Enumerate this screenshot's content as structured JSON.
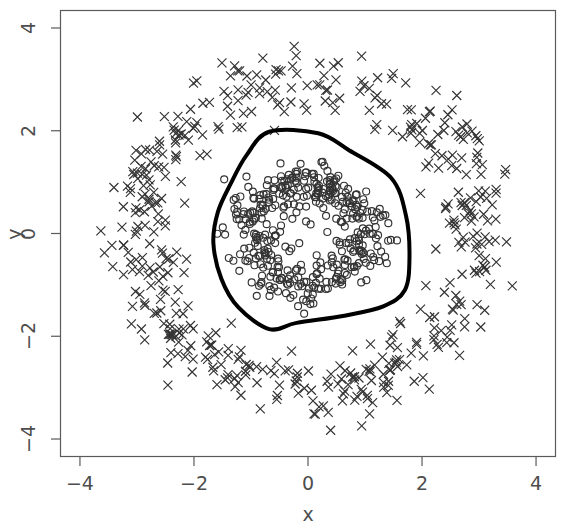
{
  "chart_data": {
    "type": "scatter",
    "title": "",
    "xlabel": "x",
    "ylabel": "y",
    "xlim": [
      -4.35,
      4.35
    ],
    "ylim": [
      -4.35,
      4.35
    ],
    "xticks": [
      -4,
      -2,
      0,
      2,
      4
    ],
    "yticks": [
      -4,
      -2,
      0,
      2,
      4
    ],
    "xtick_labels": [
      "−4",
      "−2",
      "0",
      "2",
      "4"
    ],
    "ytick_labels": [
      "−4",
      "−2",
      "0",
      "2",
      "4"
    ],
    "grid": false,
    "legend": "none",
    "box": true,
    "annotations": [],
    "series": [
      {
        "name": "inner class (circles)",
        "marker": "circle-open",
        "marker_size": 7,
        "color": "#333333",
        "n_points": 400,
        "description": "Noisy ring of open circles, mean radius 1.0, radial sd 0.25, centered at origin",
        "ring": {
          "center": [
            0,
            0
          ],
          "radius": 1.0,
          "radial_noise_sd": 0.25
        },
        "x": [
          -0.11,
          0.9,
          -0.99,
          0.27,
          -0.66,
          1.19,
          0.06,
          -1.02,
          0.84,
          -0.42,
          1.05,
          -0.81,
          0.39,
          -0.18,
          1.12,
          -1.18,
          0.62,
          0.01,
          -0.74,
          0.95,
          -0.51,
          1.21,
          -0.3,
          0.7,
          -1.1,
          0.45,
          -0.93,
          0.15,
          1.08,
          -0.62,
          0.8,
          -1.24,
          0.33,
          0.52,
          -0.86,
          1.02,
          -0.22,
          0.66,
          -1.06,
          0.1,
          0.88,
          -0.7,
          1.16,
          -0.41,
          0.24,
          -1.15,
          0.57,
          0.97,
          -0.55,
          0.36,
          -1.01,
          0.73,
          0.04,
          -0.79,
          1.1,
          -0.35,
          0.6,
          -1.2,
          0.85,
          -0.09,
          0.49,
          -0.96,
          1.22,
          -0.68,
          0.19,
          0.92,
          -1.08,
          0.41,
          0.64,
          -0.47,
          1.04,
          -0.88,
          0.28,
          -0.14,
          1.18,
          -1.12,
          0.75,
          0.08,
          -0.72,
          0.99,
          -0.58,
          1.14,
          -0.26,
          0.68,
          -1.04,
          0.43,
          -0.91,
          0.12,
          1.06,
          -0.65,
          0.78,
          -1.22,
          0.31,
          0.54,
          -0.84,
          1.0,
          -0.2,
          0.71,
          -1.02,
          0.16
        ],
        "y": [
          1.05,
          0.52,
          0.44,
          -1.08,
          0.82,
          -0.31,
          -1.12,
          -0.55,
          0.71,
          1.0,
          0.2,
          -0.8,
          1.09,
          -1.15,
          0.38,
          0.15,
          -0.92,
          1.18,
          0.74,
          -0.48,
          -1.0,
          0.1,
          1.13,
          0.86,
          -0.4,
          -1.05,
          0.58,
          1.2,
          -0.26,
          -0.95,
          0.66,
          0.05,
          -1.18,
          0.99,
          -0.68,
          -0.42,
          1.14,
          -0.88,
          0.3,
          -1.22,
          0.6,
          -0.84,
          0.22,
          1.08,
          -1.1,
          -0.35,
          0.94,
          -0.5,
          0.9,
          1.12,
          0.48,
          -0.78,
          1.22,
          0.7,
          -0.34,
          -1.06,
          0.98,
          -0.18,
          -0.62,
          1.18,
          -1.02,
          -0.44,
          0.08,
          0.88,
          1.16,
          -0.56,
          0.28,
          -1.12,
          0.92,
          1.04,
          0.36,
          -0.64,
          1.2,
          -1.18,
          -0.22,
          0.18,
          0.8,
          -1.21,
          -0.76,
          0.42,
          0.96,
          -0.3,
          -1.14,
          -0.9,
          0.52,
          1.1,
          -0.6,
          -1.19,
          0.32,
          0.9,
          -0.74,
          0.02,
          1.16,
          -1.0,
          0.72,
          0.46,
          -1.13,
          0.84,
          -0.54,
          1.2
        ]
      },
      {
        "name": "outer class (crosses)",
        "marker": "cross-x",
        "marker_size": 9,
        "color": "#333333",
        "n_points": 500,
        "description": "Noisy ring of x-shaped crosses, mean radius 3.0, radial sd 0.30, centered at origin",
        "ring": {
          "center": [
            0,
            0
          ],
          "radius": 3.0,
          "radial_noise_sd": 0.3
        }
      }
    ],
    "contour": {
      "name": "decision boundary",
      "color": "#000000",
      "line_width": 4,
      "closed": true,
      "description": "Thick black closed contour, rounded pentagon shape, radius 1.6 to 2.0",
      "vertices": [
        [
          -0.68,
          1.98
        ],
        [
          0.18,
          1.95
        ],
        [
          0.72,
          1.62
        ],
        [
          1.46,
          1.08
        ],
        [
          1.72,
          0.34
        ],
        [
          1.78,
          -0.46
        ],
        [
          1.7,
          -1.1
        ],
        [
          1.32,
          -1.42
        ],
        [
          0.64,
          -1.6
        ],
        [
          -0.2,
          -1.74
        ],
        [
          -0.68,
          -1.86
        ],
        [
          -1.22,
          -1.44
        ],
        [
          -1.52,
          -0.88
        ],
        [
          -1.66,
          -0.18
        ],
        [
          -1.58,
          0.42
        ],
        [
          -1.36,
          0.96
        ],
        [
          -1.08,
          1.52
        ]
      ]
    }
  },
  "axes": {
    "x_title": "x",
    "y_title": "y"
  }
}
